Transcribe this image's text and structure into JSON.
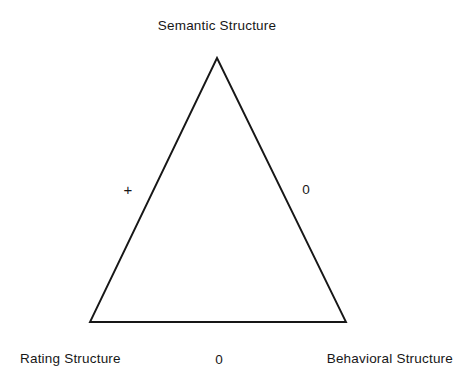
{
  "figure": {
    "type": "triangle-diagram",
    "background_color": "#ffffff",
    "stroke_color": "#171717",
    "text_color": "#171717",
    "vertices": [
      {
        "id": "semantic",
        "label": "Semantic Structure",
        "x": 217,
        "y": 58,
        "position": "apex"
      },
      {
        "id": "rating",
        "label": "Rating Structure",
        "x": 90,
        "y": 322,
        "position": "bottom-left"
      },
      {
        "id": "behavioral",
        "label": "Behavioral Structure",
        "x": 346,
        "y": 322,
        "position": "bottom-right"
      }
    ],
    "edges": [
      {
        "id": "rating-semantic",
        "from": "rating",
        "to": "semantic",
        "mark": "+",
        "mark_x": 128,
        "mark_y": 189
      },
      {
        "id": "semantic-behavioral",
        "from": "semantic",
        "to": "behavioral",
        "mark": "0",
        "mark_x": 306,
        "mark_y": 189
      },
      {
        "id": "rating-behavioral",
        "from": "rating",
        "to": "behavioral",
        "mark": "0",
        "mark_x": 219,
        "mark_y": 359
      }
    ]
  },
  "labels": {
    "semantic_structure": "Semantic Structure",
    "rating_structure": "Rating Structure",
    "behavioral_structure": "Behavioral Structure"
  },
  "edge_marks": {
    "left_edge": "+",
    "right_edge": "0",
    "bottom_edge": "0"
  }
}
